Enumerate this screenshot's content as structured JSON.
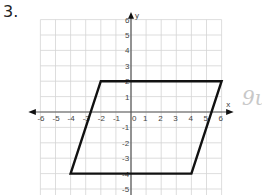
{
  "problem": {
    "number": "3."
  },
  "graph": {
    "x_label": "x",
    "y_label": "y",
    "x_ticks": [
      "-6",
      "-5",
      "-4",
      "-3",
      "-2",
      "-1",
      "0",
      "1",
      "2",
      "3",
      "4",
      "5",
      "6"
    ],
    "y_ticks_pos": [
      "6",
      "5",
      "4",
      "3",
      "2",
      "1"
    ],
    "y_ticks_neg": [
      "-1",
      "-2",
      "-3",
      "-4",
      "-5"
    ],
    "x_range": [
      -6,
      6
    ],
    "y_range": [
      -5.5,
      6
    ],
    "grid": true
  },
  "shape": {
    "type": "parallelogram",
    "vertices": [
      [
        -2,
        2
      ],
      [
        6,
        2
      ],
      [
        4,
        -4
      ],
      [
        -4,
        -4
      ]
    ],
    "stroke": "#111111"
  },
  "handwriting": {
    "text": "9u"
  },
  "colors": {
    "grid": "#d4d4d4",
    "axis": "#555555",
    "shape": "#111111"
  }
}
